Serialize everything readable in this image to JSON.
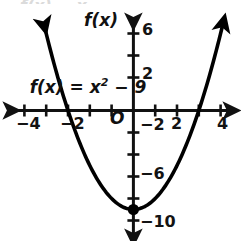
{
  "figure": {
    "background_color": "#ffffff",
    "ink_color": "#111111",
    "top_cropped_text": "f(x) = x",
    "equation_label": {
      "prefix": "f(x) = x",
      "exponent": "2",
      "suffix": " − 9",
      "full": "f(x) = x² − 9"
    },
    "vertical_axis_label": "f(x)",
    "origin_label": "O"
  },
  "chart_data": {
    "type": "line",
    "subtitle": "",
    "xlabel": "",
    "ylabel": "f(x)",
    "grid": false,
    "legend": "none",
    "annotations": [
      {
        "text": "f(x) = x² − 9",
        "x": -3.6,
        "y": 2.6,
        "role": "equation-label"
      },
      {
        "text": "O",
        "x": -0.35,
        "y": -0.6,
        "role": "origin-label"
      },
      {
        "text": "f(x)",
        "x": -0.9,
        "y": 7.6,
        "role": "axis-label"
      }
    ],
    "xlim": [
      -5.3,
      5.2
    ],
    "ylim": [
      -11.2,
      7.6
    ],
    "x_tick_values": [
      -5,
      -4,
      -3,
      -2,
      -1,
      1,
      2,
      3,
      4,
      5
    ],
    "x_tick_labels_shown": [
      "-4",
      "-2",
      "2",
      "4"
    ],
    "x_tick_label_values": [
      -4,
      -2,
      2,
      4
    ],
    "y_tick_values": [
      -10,
      -8,
      -6,
      -4,
      -2,
      2,
      4,
      6
    ],
    "y_tick_labels_shown": [
      "6",
      "2",
      "-2",
      "-6",
      "-10"
    ],
    "y_tick_label_values": [
      6,
      2,
      -2,
      -6,
      -10
    ],
    "axis_arrows": [
      "left",
      "right",
      "up",
      "down"
    ],
    "series": [
      {
        "name": "f(x) = x² − 9",
        "type": "parabola",
        "color": "#000000",
        "line_width": 3,
        "arrow_ends": [
          "left",
          "right"
        ],
        "vertex": {
          "x": 0,
          "y": -9,
          "marker": "filled-circle"
        },
        "x_intercepts": [
          -3,
          3
        ],
        "y_intercept": -9,
        "x": [
          -4.1,
          -3.8,
          -3.5,
          -3.0,
          -2.5,
          -2.0,
          -1.5,
          -1.0,
          -0.5,
          0.0,
          0.5,
          1.0,
          1.5,
          2.0,
          2.5,
          3.0,
          3.5,
          3.8,
          4.1
        ],
        "y": [
          7.81,
          5.44,
          3.25,
          0.0,
          -2.75,
          -5.0,
          -6.75,
          -8.0,
          -8.75,
          -9.0,
          -8.75,
          -8.0,
          -6.75,
          -5.0,
          -2.75,
          0.0,
          3.25,
          5.44,
          7.81
        ]
      }
    ]
  },
  "tick_labels": {
    "x_neg4": "−4",
    "x_neg2": "−2",
    "x_2": "2",
    "x_4": "4",
    "y_6": "6",
    "y_2": "2",
    "y_neg2": "−2",
    "y_neg6": "−6",
    "y_neg10": "−10"
  }
}
